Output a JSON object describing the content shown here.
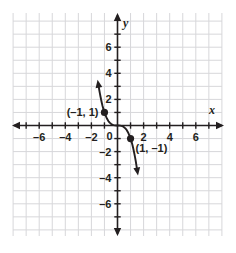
{
  "chart_data": {
    "type": "line",
    "title": "",
    "xlabel": "x",
    "ylabel": "y",
    "xlim": [
      -8,
      8
    ],
    "ylim": [
      -8,
      8
    ],
    "grid": true,
    "grid_step": 1,
    "legend": "none",
    "x_tick_labels": [
      "–6",
      "–4",
      "–2",
      "0",
      "2",
      "4",
      "6"
    ],
    "x_tick_values": [
      -6,
      -4,
      -2,
      0,
      2,
      4,
      6
    ],
    "y_tick_labels": [
      "6",
      "4",
      "2",
      "–2",
      "–4",
      "–6"
    ],
    "y_tick_values": [
      6,
      4,
      2,
      -2,
      -4,
      -6
    ],
    "origin_label": "0",
    "series": [
      {
        "name": "curve",
        "equation_shape": "decreasing cubic through (-1,1), (0,0), (1,-1)",
        "color": "#231f20",
        "arrow_start": true,
        "arrow_end": true,
        "x": [
          -1.45,
          -1.4,
          -1.35,
          -1.3,
          -1.25,
          -1.2,
          -1.15,
          -1.1,
          -1.05,
          -1.0,
          -0.9,
          -0.8,
          -0.7,
          -0.6,
          -0.5,
          -0.4,
          -0.3,
          -0.2,
          -0.1,
          0.0,
          0.1,
          0.2,
          0.3,
          0.4,
          0.5,
          0.6,
          0.7,
          0.8,
          0.9,
          1.0,
          1.05,
          1.1,
          1.15,
          1.2,
          1.25,
          1.3,
          1.35,
          1.4,
          1.45,
          1.5
        ],
        "y": [
          3.05,
          2.74,
          2.46,
          2.2,
          1.95,
          1.73,
          1.52,
          1.33,
          1.16,
          1.0,
          0.73,
          0.51,
          0.34,
          0.22,
          0.13,
          0.06,
          0.03,
          0.01,
          0.0,
          0.0,
          0.0,
          -0.01,
          -0.03,
          -0.06,
          -0.13,
          -0.22,
          -0.34,
          -0.51,
          -0.73,
          -1.0,
          -1.16,
          -1.33,
          -1.52,
          -1.73,
          -1.95,
          -2.2,
          -2.46,
          -2.74,
          -3.05,
          -3.38
        ]
      }
    ],
    "points": [
      {
        "label": "(–1, 1)",
        "x": -1,
        "y": 1,
        "label_side": "left"
      },
      {
        "label": "(1, –1)",
        "x": 1,
        "y": -1,
        "label_side": "right"
      }
    ],
    "colors": {
      "grid": "#d7d7da",
      "axis": "#231f20",
      "curve": "#231f20",
      "point": "#231f20",
      "background": "#ffffff"
    }
  }
}
